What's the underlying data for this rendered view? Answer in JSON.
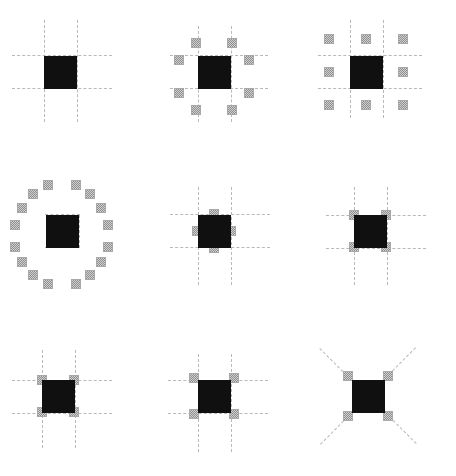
{
  "figure": {
    "width": 456,
    "height": 476,
    "background_color": "#ffffff",
    "center_color": "#101010",
    "neighbor_color": "#cfcfcf",
    "neighbor_pattern": "checkered-dither",
    "line_color": "#b9b9b9",
    "line_style": "dashed",
    "rows": 3,
    "columns": 3
  },
  "chart_data": {
    "type": "diagram-grid",
    "cell_width": 152,
    "cell_height": 159,
    "center_square_size": 33,
    "neighbor_square_size": 10,
    "panels": [
      {
        "index": 1,
        "name": "no-neighbors",
        "label": "",
        "neighbor_count": 0,
        "center": [
          60,
          72
        ],
        "neighbors": [],
        "lines": {
          "vertical_x": [
            44,
            77
          ],
          "vertical_span": [
            20,
            122
          ],
          "horizontal_y": [
            55,
            88
          ],
          "horizontal_span": [
            12,
            112
          ],
          "diagonals": []
        }
      },
      {
        "index": 2,
        "name": "eight-offset-neighbors",
        "label": "",
        "neighbor_count": 8,
        "center": [
          62,
          72
        ],
        "neighbors": [
          [
            44,
            43
          ],
          [
            80,
            43
          ],
          [
            27,
            60
          ],
          [
            97,
            60
          ],
          [
            27,
            93
          ],
          [
            97,
            93
          ],
          [
            44,
            110
          ],
          [
            80,
            110
          ]
        ],
        "lines": {
          "vertical_x": [
            46,
            79
          ],
          "vertical_span": [
            26,
            122
          ],
          "horizontal_y": [
            55,
            88
          ],
          "horizontal_span": [
            18,
            116
          ],
          "diagonals": []
        }
      },
      {
        "index": 3,
        "name": "moore-neighborhood-3x3",
        "label": "",
        "neighbor_count": 8,
        "center": [
          62,
          72
        ],
        "neighbors": [
          [
            25,
            39
          ],
          [
            62,
            39
          ],
          [
            99,
            39
          ],
          [
            25,
            72
          ],
          [
            99,
            72
          ],
          [
            25,
            105
          ],
          [
            62,
            105
          ],
          [
            99,
            105
          ]
        ],
        "lines": {
          "vertical_x": [
            46,
            79
          ],
          "vertical_span": [
            20,
            118
          ],
          "horizontal_y": [
            55,
            88
          ],
          "horizontal_span": [
            14,
            118
          ],
          "diagonals": []
        }
      },
      {
        "index": 4,
        "name": "radial-sixteen-neighbors",
        "label": "",
        "neighbor_count": 16,
        "center": [
          62,
          72
        ],
        "neighbors": [
          [
            48,
            26
          ],
          [
            76,
            26
          ],
          [
            33,
            35
          ],
          [
            90,
            35
          ],
          [
            22,
            49
          ],
          [
            101,
            49
          ],
          [
            15,
            66
          ],
          [
            108,
            66
          ],
          [
            15,
            88
          ],
          [
            108,
            88
          ],
          [
            22,
            103
          ],
          [
            101,
            103
          ],
          [
            33,
            116
          ],
          [
            90,
            116
          ],
          [
            48,
            125
          ],
          [
            76,
            125
          ]
        ],
        "lines": {
          "vertical_x": [
            46,
            79
          ],
          "vertical_span": [
            56,
            89
          ],
          "horizontal_y": [
            55,
            88
          ],
          "horizontal_span": [
            45,
            80
          ],
          "diagonals": []
        }
      },
      {
        "index": 5,
        "name": "von-neumann-edge-neighbors",
        "label": "",
        "neighbor_count": 4,
        "center": [
          62,
          72
        ],
        "neighbors": [
          [
            62,
            55
          ],
          [
            62,
            89
          ],
          [
            45,
            72
          ],
          [
            79,
            72
          ]
        ],
        "lines": {
          "vertical_x": [
            46,
            79
          ],
          "vertical_span": [
            28,
            126
          ],
          "horizontal_y": [
            55,
            88
          ],
          "horizontal_span": [
            18,
            118
          ],
          "diagonals": []
        }
      },
      {
        "index": 6,
        "name": "corner-diagonal-neighbors",
        "label": "",
        "neighbor_count": 4,
        "center": [
          66,
          72
        ],
        "neighbors": [
          [
            50,
            56
          ],
          [
            82,
            56
          ],
          [
            50,
            88
          ],
          [
            82,
            88
          ]
        ],
        "lines": {
          "vertical_x": [
            50,
            83
          ],
          "vertical_span": [
            28,
            126
          ],
          "horizontal_y": [
            56,
            89
          ],
          "horizontal_span": [
            22,
            122
          ],
          "diagonals": []
        }
      },
      {
        "index": 7,
        "name": "corner-neighbors-on-vertices",
        "label": "",
        "neighbor_count": 4,
        "center": [
          58,
          78
        ],
        "neighbors": [
          [
            42,
            62
          ],
          [
            74,
            62
          ],
          [
            42,
            94
          ],
          [
            74,
            94
          ]
        ],
        "lines": {
          "vertical_x": [
            42,
            75
          ],
          "vertical_span": [
            32,
            130
          ],
          "horizontal_y": [
            62,
            95
          ],
          "horizontal_span": [
            12,
            112
          ],
          "diagonals": []
        }
      },
      {
        "index": 8,
        "name": "corner-neighbors-outside",
        "label": "",
        "neighbor_count": 4,
        "center": [
          62,
          78
        ],
        "neighbors": [
          [
            42,
            60
          ],
          [
            82,
            60
          ],
          [
            42,
            96
          ],
          [
            82,
            96
          ]
        ],
        "lines": {
          "vertical_x": [
            46,
            79
          ],
          "vertical_span": [
            36,
            134
          ],
          "horizontal_y": [
            62,
            95
          ],
          "horizontal_span": [
            16,
            116
          ],
          "diagonals": []
        }
      },
      {
        "index": 9,
        "name": "diagonal-axis-neighbors",
        "label": "",
        "neighbor_count": 4,
        "center": [
          64,
          78
        ],
        "neighbors": [
          [
            44,
            58
          ],
          [
            84,
            58
          ],
          [
            44,
            98
          ],
          [
            84,
            98
          ]
        ],
        "lines": {
          "vertical_x": [],
          "vertical_span": [],
          "horizontal_y": [],
          "horizontal_span": [],
          "diagonals": [
            {
              "from": [
                16,
                30
              ],
              "to": [
                64,
                78
              ]
            },
            {
              "from": [
                112,
                30
              ],
              "to": [
                64,
                78
              ]
            },
            {
              "from": [
                16,
                126
              ],
              "to": [
                64,
                78
              ]
            },
            {
              "from": [
                112,
                126
              ],
              "to": [
                64,
                78
              ]
            }
          ]
        }
      }
    ]
  }
}
